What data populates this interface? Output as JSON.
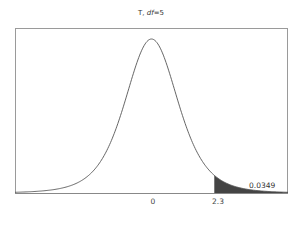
{
  "chart_data": {
    "type": "area",
    "title": "T, df=5",
    "distribution": "Student t",
    "df": 5,
    "xlabel": "",
    "ylabel": "",
    "xlim": [
      -5,
      5
    ],
    "x_ticks": [
      {
        "value": 0,
        "label": "0"
      },
      {
        "value": 2.3,
        "label": "2.3"
      }
    ],
    "shaded_region": {
      "from": 2.3,
      "to": 5,
      "tail": "upper"
    },
    "annotations": [
      {
        "text": "0.0349",
        "x": 3.6,
        "note": "upper-tail probability P(T > 2.3)"
      }
    ],
    "grid": false,
    "legend": null,
    "colors": {
      "curve": "#555555",
      "shade": "#444444",
      "frame": "#999999"
    }
  },
  "title": {
    "prefix": "T, ",
    "df_label": "df",
    "df_value": "=5"
  },
  "ticks": {
    "zero": "0",
    "cut": "2.3"
  },
  "area_label": "0.0349"
}
